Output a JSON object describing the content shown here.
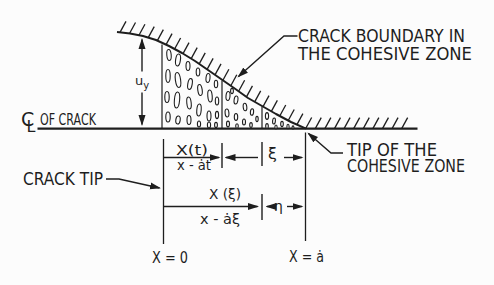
{
  "figure": {
    "background": "#fcfcfc",
    "ink": "#1e1e1e",
    "centerline": {
      "symbol_c": "C",
      "symbol_l": "L",
      "label": "OF CRACK"
    },
    "crack_opening": {
      "symbol": "u",
      "subscript": "y"
    },
    "labels": {
      "boundary_line1": "CRACK BOUNDARY IN",
      "boundary_line2": "THE COHESIVE ZONE",
      "zone_tip_line1": "TIP OF THE",
      "zone_tip_line2": "COHESIVE ZONE",
      "crack_tip": "CRACK TIP"
    },
    "dimensions": {
      "moving_frame_numerator": "X(t)",
      "moving_frame_denominator": "x - ȧt",
      "xi": "ξ",
      "retarded_frame_numerator": "X (ξ)",
      "retarded_frame_denominator": "x - ȧξ",
      "eta": "η",
      "crack_tip_position": "X = 0",
      "zone_tip_position": "X = ȧ"
    }
  }
}
